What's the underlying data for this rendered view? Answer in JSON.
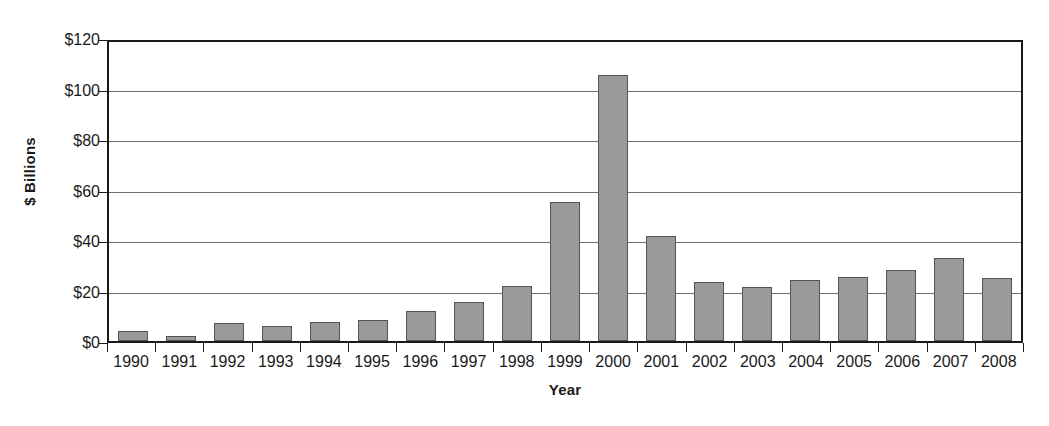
{
  "chart_data": {
    "type": "bar",
    "title": "",
    "xlabel": "Year",
    "ylabel": "$ Billions",
    "ylim": [
      0,
      120
    ],
    "ytick_step": 20,
    "ytick_labels": [
      "$0",
      "$20",
      "$40",
      "$60",
      "$80",
      "$100",
      "$120"
    ],
    "ytick_values": [
      0,
      20,
      40,
      60,
      80,
      100,
      120
    ],
    "grid": true,
    "legend": false,
    "bar_color": "#9a9a9a",
    "bar_edge_color": "#545454",
    "axis_color": "#1a1a1a",
    "gridline_color": "#6f6f6f",
    "categories": [
      "1990",
      "1991",
      "1992",
      "1993",
      "1994",
      "1995",
      "1996",
      "1997",
      "1998",
      "1999",
      "2000",
      "2001",
      "2002",
      "2003",
      "2004",
      "2005",
      "2006",
      "2007",
      "2008"
    ],
    "values": [
      4,
      2,
      7,
      6,
      7.5,
      8.5,
      12,
      15.5,
      22,
      55.5,
      106,
      42,
      23.5,
      21.5,
      24.5,
      25.5,
      28.5,
      33,
      25
    ]
  }
}
